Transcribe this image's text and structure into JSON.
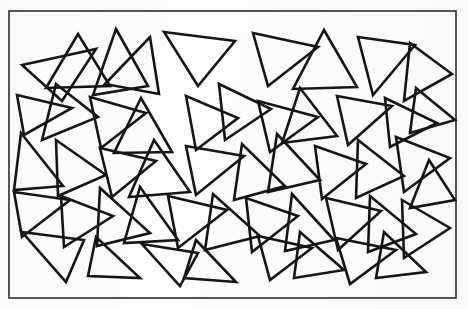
{
  "figure": {
    "background_color": "#fdfdfd",
    "stroke_color": "#151515",
    "frame_color": "#2c2c2c",
    "stroke_width": 2.6,
    "frame_stroke_width": 1.6,
    "width": 468,
    "height": 309,
    "triangle_count": 47,
    "frame": {
      "x": 9,
      "y": 11,
      "width": 447,
      "height": 287
    },
    "triangles": [
      {
        "name": "triangle-01",
        "points": "22,65 96,49 62,101"
      },
      {
        "name": "triangle-02",
        "points": "78,34 110,86 46,88"
      },
      {
        "name": "triangle-03",
        "points": "105,84 150,37 159,94"
      },
      {
        "name": "triangle-04",
        "points": "116,29 148,86 93,95"
      },
      {
        "name": "triangle-05",
        "points": "164,32 235,41 198,86"
      },
      {
        "name": "triangle-06",
        "points": "253,33 318,47 268,86"
      },
      {
        "name": "triangle-07",
        "points": "324,30 357,87 293,89"
      },
      {
        "name": "triangle-08",
        "points": "358,37 415,45 373,95"
      },
      {
        "name": "triangle-09",
        "points": "410,43 452,74 404,101"
      },
      {
        "name": "triangle-10",
        "points": "17,95 72,108 24,135"
      },
      {
        "name": "triangle-11",
        "points": "56,84 98,117 42,140"
      },
      {
        "name": "triangle-12",
        "points": "90,97 146,113 101,148"
      },
      {
        "name": "triangle-13",
        "points": "141,98 172,152 114,153"
      },
      {
        "name": "triangle-14",
        "points": "186,96 238,118 196,150"
      },
      {
        "name": "triangle-15",
        "points": "219,84 271,109 225,140"
      },
      {
        "name": "triangle-16",
        "points": "258,101 318,117 270,152"
      },
      {
        "name": "triangle-17",
        "points": "300,88 337,136 282,143"
      },
      {
        "name": "triangle-18",
        "points": "337,96 392,106 348,145"
      },
      {
        "name": "triangle-19",
        "points": "385,98 437,123 390,147"
      },
      {
        "name": "triangle-20",
        "points": "416,88 455,120 410,133"
      },
      {
        "name": "triangle-21",
        "points": "21,133 63,186 14,190"
      },
      {
        "name": "triangle-22",
        "points": "56,140 106,175 58,196"
      },
      {
        "name": "triangle-23",
        "points": "100,148 156,161 112,197"
      },
      {
        "name": "triangle-24",
        "points": "154,140 190,192 129,197"
      },
      {
        "name": "triangle-25",
        "points": "186,146 244,156 196,195"
      },
      {
        "name": "triangle-26",
        "points": "242,144 285,186 234,200"
      },
      {
        "name": "triangle-27",
        "points": "277,134 320,180 268,192"
      },
      {
        "name": "triangle-28",
        "points": "315,146 366,164 322,199"
      },
      {
        "name": "triangle-29",
        "points": "358,140 404,176 356,198"
      },
      {
        "name": "triangle-30",
        "points": "396,137 450,158 404,192"
      },
      {
        "name": "triangle-31",
        "points": "429,160 455,200 410,208"
      },
      {
        "name": "triangle-32",
        "points": "14,192 70,200 22,237"
      },
      {
        "name": "triangle-33",
        "points": "61,196 113,216 64,247"
      },
      {
        "name": "triangle-34",
        "points": "100,188 150,233 97,246"
      },
      {
        "name": "triangle-35",
        "points": "140,187 178,240 124,243"
      },
      {
        "name": "triangle-36",
        "points": "168,196 227,210 178,248"
      },
      {
        "name": "triangle-37",
        "points": "213,194 260,236 205,250"
      },
      {
        "name": "triangle-38",
        "points": "246,198 298,216 252,252"
      },
      {
        "name": "triangle-39",
        "points": "292,194 334,240 285,251"
      },
      {
        "name": "triangle-40",
        "points": "326,198 381,211 338,250"
      },
      {
        "name": "triangle-41",
        "points": "370,196 416,234 368,252"
      },
      {
        "name": "triangle-42",
        "points": "402,200 450,228 404,258"
      },
      {
        "name": "triangle-43",
        "points": "22,232 84,240 66,282"
      },
      {
        "name": "triangle-44",
        "points": "96,237 140,278 88,276"
      },
      {
        "name": "triangle-45",
        "points": "142,244 198,253 180,286"
      },
      {
        "name": "triangle-46",
        "points": "196,240 236,282 184,278"
      },
      {
        "name": "triangle-47",
        "points": "258,236 312,248 270,280"
      },
      {
        "name": "triangle-48",
        "points": "300,232 344,270 294,278"
      },
      {
        "name": "triangle-49",
        "points": "336,238 396,250 350,284"
      },
      {
        "name": "triangle-50",
        "points": "384,232 426,272 376,278"
      }
    ]
  }
}
